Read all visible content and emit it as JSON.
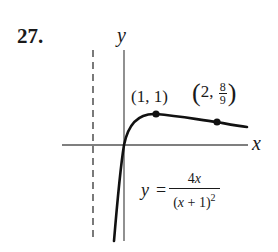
{
  "problem": {
    "number": "27."
  },
  "axes": {
    "x_label": "x",
    "y_label": "y"
  },
  "points": [
    {
      "label": "(1, 1)",
      "x": 1,
      "y": 1
    },
    {
      "label_prefix": "2,",
      "label_num": "8",
      "label_den": "9",
      "x": 2,
      "y": 0.8889
    }
  ],
  "equation": {
    "lhs": "y",
    "eq": "=",
    "numerator_coef": "4",
    "numerator_var": "x",
    "denominator_open": "(",
    "denominator_var": "x",
    "denominator_rest": " + 1)",
    "denominator_exp": "2"
  },
  "asymptote": {
    "type": "vertical",
    "x": -1,
    "style": "dashed"
  },
  "colors": {
    "ink": "#1a1a1a",
    "axis": "#555555",
    "background": "#ffffff"
  }
}
